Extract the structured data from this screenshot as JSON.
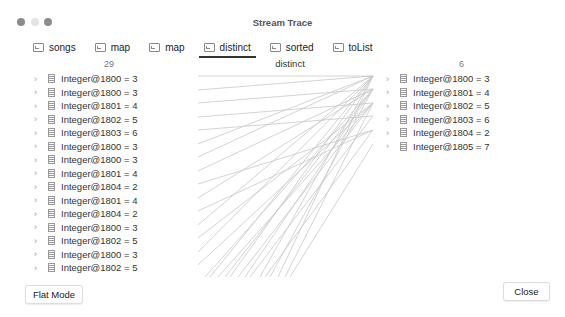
{
  "window": {
    "title": "Stream Trace",
    "traffic_lights": [
      {
        "name": "close",
        "color": "#8c8c8c"
      },
      {
        "name": "minimize",
        "color": "#e4e4e4"
      },
      {
        "name": "maximize",
        "color": "#8c8c8c"
      }
    ]
  },
  "tabs": [
    {
      "label": "songs",
      "icon": "terminal-icon",
      "active": false
    },
    {
      "label": "map",
      "icon": "terminal-icon",
      "active": false
    },
    {
      "label": "map",
      "icon": "terminal-icon",
      "active": false
    },
    {
      "label": "distinct",
      "icon": "terminal-icon",
      "active": true
    },
    {
      "label": "sorted",
      "icon": "terminal-icon",
      "active": false
    },
    {
      "label": "toList",
      "icon": "terminal-icon",
      "active": false
    }
  ],
  "left": {
    "count": "29",
    "items": [
      "Integer@1800 = 3",
      "Integer@1800 = 3",
      "Integer@1801 = 4",
      "Integer@1802 = 5",
      "Integer@1803 = 6",
      "Integer@1800 = 3",
      "Integer@1800 = 3",
      "Integer@1801 = 4",
      "Integer@1804 = 2",
      "Integer@1801 = 4",
      "Integer@1804 = 2",
      "Integer@1800 = 3",
      "Integer@1802 = 5",
      "Integer@1800 = 3",
      "Integer@1802 = 5"
    ]
  },
  "middle": {
    "label": "distinct"
  },
  "right": {
    "count": "6",
    "items": [
      "Integer@1800 = 3",
      "Integer@1801 = 4",
      "Integer@1802 = 5",
      "Integer@1803 = 6",
      "Integer@1804 = 2",
      "Integer@1805 = 7"
    ]
  },
  "buttons": {
    "flat_mode": "Flat Mode",
    "close": "Close"
  }
}
